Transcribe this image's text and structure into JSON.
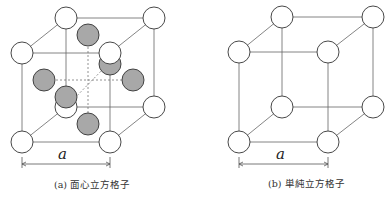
{
  "figures": [
    {
      "id": "a",
      "caption": "(a) 面心立方格子",
      "dimension_label": "a",
      "type": "face-centered cubic lattice",
      "corner_atoms": 8,
      "face_atoms": 6
    },
    {
      "id": "b",
      "caption": "(b) 単純立方格子",
      "dimension_label": "a",
      "type": "simple cubic lattice",
      "corner_atoms": 8,
      "face_atoms": 0
    }
  ],
  "colors": {
    "corner_atom_fill": "#ffffff",
    "face_atom_fill": "#a8a8a8",
    "line": "#555555"
  }
}
